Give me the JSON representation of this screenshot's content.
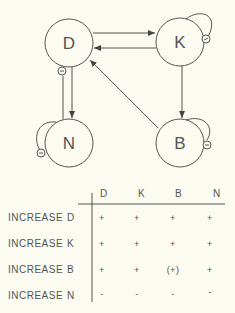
{
  "diagram": {
    "nodes": [
      {
        "id": "D",
        "label": "D",
        "cx": 69,
        "cy": 43,
        "r": 24
      },
      {
        "id": "K",
        "label": "K",
        "cx": 180,
        "cy": 42,
        "r": 24
      },
      {
        "id": "N",
        "label": "N",
        "cx": 69,
        "cy": 143,
        "r": 24
      },
      {
        "id": "B",
        "label": "B",
        "cx": 180,
        "cy": 143,
        "r": 24
      }
    ],
    "edges": [
      {
        "from": "D",
        "to": "K",
        "sign": "+"
      },
      {
        "from": "K",
        "to": "D",
        "sign": "+"
      },
      {
        "from": "D",
        "to": "N",
        "sign": "+"
      },
      {
        "from": "N",
        "to": "D",
        "sign": "-"
      },
      {
        "from": "K",
        "to": "B",
        "sign": "+"
      },
      {
        "from": "B",
        "to": "D",
        "sign": "+"
      },
      {
        "from": "K",
        "to": "K",
        "sign": "-"
      },
      {
        "from": "N",
        "to": "N",
        "sign": "-"
      },
      {
        "from": "B",
        "to": "B",
        "sign": "-"
      }
    ],
    "colors": {
      "stroke": "#555555",
      "background": "#fbfbf1"
    }
  },
  "table": {
    "columns": [
      "D",
      "K",
      "B",
      "N"
    ],
    "rows": [
      {
        "label": "INCREASE",
        "var": "D",
        "values": [
          "+",
          "+",
          "+",
          "+"
        ]
      },
      {
        "label": "INCREASE",
        "var": "K",
        "values": [
          "+",
          "+",
          "+",
          "+"
        ]
      },
      {
        "label": "INCREASE",
        "var": "B",
        "values": [
          "+",
          "+",
          "(+)",
          "+"
        ]
      },
      {
        "label": "INCREASE",
        "var": "N",
        "values": [
          "-",
          "-",
          "-",
          "-"
        ]
      }
    ]
  }
}
